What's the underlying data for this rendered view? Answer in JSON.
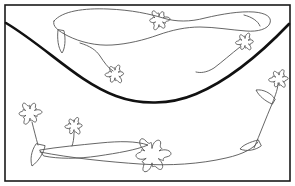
{
  "image": {
    "kind": "line-drawing",
    "title": "Flowering vines above and below a curved ground line",
    "width": 295,
    "height": 186,
    "background_color": "#ffffff"
  },
  "palette": {
    "background": "#ffffff",
    "frame_stroke": "#1a1a1a",
    "heavy_curve_stroke": "#111111",
    "thin_line_stroke": "#555555",
    "fill": "none"
  },
  "frame": {
    "name": "outer-border",
    "x": 5,
    "y": 5,
    "width": 285,
    "height": 176,
    "stroke_width": 1.6
  },
  "divider_curve": {
    "name": "heavy-ground-curve",
    "description": "thick U-shaped catenary sweeping from upper-left edge down to mid-bottom and back up to upper-right edge",
    "stroke_width": 2.6,
    "left_end": [
      6,
      23
    ],
    "right_end": [
      289,
      24
    ],
    "lowest_point": [
      150,
      101
    ],
    "path": "M 6 23 C 46 47, 78 82, 116 96 C 140 105, 170 105, 196 94 C 232 79, 266 48, 289 24"
  },
  "upper_region": {
    "name": "upper-vine-group",
    "stroke_width": 0.9,
    "elements": [
      {
        "name": "upper-vine-outline",
        "type": "vine-stem-outline",
        "path": "M 54 21 C 62 11, 84 8, 108 9 C 132 10, 150 14, 163 18 C 176 22, 190 22, 205 18 C 222 14, 240 11, 254 12 C 266 13, 272 17, 270 23 C 268 29, 258 32, 246 31 C 232 30, 214 27, 200 27 C 186 27, 172 30, 158 35 C 144 40, 128 44, 112 45 C 96 46, 80 42, 68 36 C 58 31, 52 26, 54 21 Z"
      },
      {
        "name": "upper-leaf-left",
        "type": "leaf",
        "path": "M 58 30 C 57 38, 58 48, 62 53 C 65 49, 66 39, 64 31 Z"
      },
      {
        "name": "upper-stem-to-flower-left",
        "type": "stem",
        "path": "M 80 43 C 90 46, 96 50, 100 56 C 104 62, 108 68, 113 71"
      },
      {
        "name": "upper-flower-left",
        "type": "flower",
        "center": [
          115,
          74
        ],
        "radius": 7.5,
        "petals": 6
      },
      {
        "name": "upper-flower-center",
        "type": "flower",
        "center": [
          159,
          20
        ],
        "radius": 8,
        "petals": 6
      },
      {
        "name": "upper-flower-right",
        "type": "flower",
        "center": [
          245,
          42
        ],
        "radius": 7,
        "petals": 6
      },
      {
        "name": "upper-stem-to-flower-right",
        "type": "stem",
        "path": "M 240 47 C 231 54, 222 62, 214 68 C 206 73, 200 73, 196 72"
      },
      {
        "name": "upper-tail-curve",
        "type": "stem",
        "path": "M 244 15 C 252 17, 258 21, 260 26"
      }
    ]
  },
  "lower_region": {
    "name": "lower-vine-group",
    "stroke_width": 0.9,
    "elements": [
      {
        "name": "lower-flower-left",
        "type": "flower",
        "center": [
          30,
          113
        ],
        "radius": 9,
        "petals": 6
      },
      {
        "name": "lower-stem-left",
        "type": "stem",
        "path": "M 32 122 C 34 130, 36 138, 38 145"
      },
      {
        "name": "lower-leaf-left",
        "type": "leaf",
        "path": "M 36 144 C 31 151, 30 160, 32 166 C 39 161, 44 152, 45 146 Z"
      },
      {
        "name": "lower-flower-small",
        "type": "flower",
        "center": [
          74,
          126
        ],
        "radius": 7,
        "petals": 6
      },
      {
        "name": "lower-stem-small",
        "type": "stem",
        "path": "M 74 133 C 74 139, 73 143, 72 146"
      },
      {
        "name": "lower-vine-outline",
        "type": "vine-stem-outline",
        "path": "M 40 150 C 58 147, 80 145, 100 143 C 120 141, 136 141, 148 145 C 136 150, 118 153, 98 156 C 78 159, 58 159, 44 156 Z"
      },
      {
        "name": "lower-vine-long-sweep",
        "type": "stem",
        "path": "M 40 152 C 70 158, 110 162, 140 164 C 170 166, 200 164, 226 158 C 244 154, 254 148, 258 142"
      },
      {
        "name": "lower-flower-big-center",
        "type": "flower",
        "center": [
          152,
          155
        ],
        "radius": 14,
        "petals": 6
      },
      {
        "name": "right-stem-rising",
        "type": "stem",
        "path": "M 254 148 C 260 134, 266 118, 272 104 C 276 94, 278 88, 278 83"
      },
      {
        "name": "right-leaf-lower",
        "type": "leaf",
        "path": "M 258 140 C 250 142, 243 145, 240 149 C 247 152, 256 150, 261 146 Z"
      },
      {
        "name": "right-leaf-upper",
        "type": "leaf",
        "path": "M 272 104 C 265 101, 259 96, 256 90 C 263 89, 271 93, 275 99 Z"
      },
      {
        "name": "right-flower-top",
        "type": "flower",
        "center": [
          279,
          79
        ],
        "radius": 7.5,
        "petals": 6
      }
    ]
  }
}
